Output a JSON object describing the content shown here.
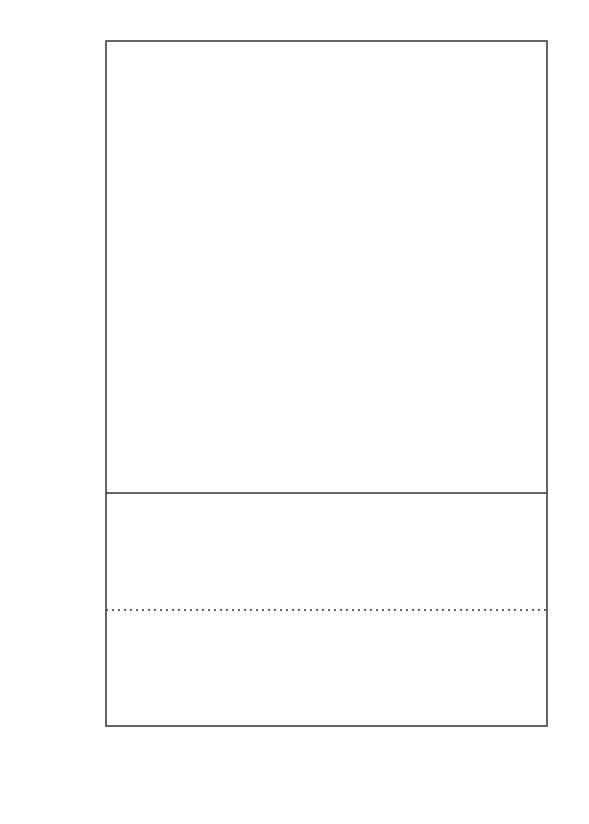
{
  "chart_data": [
    {
      "panel": "top",
      "type": "scatter",
      "title": "",
      "xlabel": "Mass (M_Sun)",
      "ylabel": "Radius (R_Sun)",
      "xlim": [
        1.0,
        0.0
      ],
      "ylim": [
        0.0,
        1.1
      ],
      "x_ticks": [
        "1.0",
        "0.8",
        "0.6",
        "0.4",
        "0.2",
        "0.0"
      ],
      "y_ticks": [
        "0.0",
        "0.2",
        "0.4",
        "0.6",
        "0.8",
        "1.0"
      ],
      "grid": false,
      "legend_position": "upper right",
      "legend": [
        {
          "label": "Single stars (NEW)",
          "color": "#111111"
        },
        {
          "label": "Single stars (published)",
          "color": "#444444"
        },
        {
          "label": "Eclipsing binaries",
          "color": "#c8c8c8"
        },
        {
          "label": "Interferometric binaries",
          "color": "#6e6e6e"
        }
      ],
      "model_curves": [
        {
          "name": "model solid",
          "style": "solid",
          "points": [
            [
              1.0,
              1.0
            ],
            [
              0.9,
              0.905
            ],
            [
              0.8,
              0.8
            ],
            [
              0.7,
              0.7
            ],
            [
              0.6,
              0.6
            ],
            [
              0.5,
              0.5
            ],
            [
              0.4,
              0.4
            ],
            [
              0.3,
              0.3
            ],
            [
              0.2,
              0.21
            ],
            [
              0.15,
              0.16
            ],
            [
              0.1,
              0.115
            ],
            [
              0.075,
              0.085
            ]
          ]
        },
        {
          "name": "model dashed",
          "style": "dashed",
          "points": [
            [
              0.99,
              1.1
            ],
            [
              0.9,
              0.98
            ],
            [
              0.8,
              0.84
            ],
            [
              0.7,
              0.72
            ],
            [
              0.63,
              0.63
            ]
          ]
        }
      ],
      "series": [
        {
          "name": "Single stars (NEW)",
          "color": "#111111",
          "points": [
            {
              "x": 0.92,
              "y": 0.82,
              "xerr": 0.08,
              "yerr": 0
            },
            {
              "x": 0.86,
              "y": 0.795,
              "xerr": 0.1,
              "yerr": 0
            },
            {
              "x": 0.84,
              "y": 0.78,
              "xerr": 0.09,
              "yerr": 0
            },
            {
              "x": 0.84,
              "y": 0.767,
              "xerr": 0.09,
              "yerr": 0
            },
            {
              "x": 0.85,
              "y": 0.75,
              "xerr": 0.09,
              "yerr": 0
            },
            {
              "x": 0.81,
              "y": 0.687,
              "xerr": 0.1,
              "yerr": 0
            },
            {
              "x": 0.78,
              "y": 0.66,
              "xerr": 0.09,
              "yerr": 0
            },
            {
              "x": 0.78,
              "y": 0.648,
              "xerr": 0.09,
              "yerr": 0
            },
            {
              "x": 0.77,
              "y": 0.628,
              "xerr": 0.09,
              "yerr": 0
            },
            {
              "x": 0.62,
              "y": 0.562,
              "xerr": 0.06,
              "yerr": 0
            },
            {
              "x": 0.6,
              "y": 0.565,
              "xerr": 0.06,
              "yerr": 0
            },
            {
              "x": 0.58,
              "y": 0.535,
              "xerr": 0.06,
              "yerr": 0
            },
            {
              "x": 0.49,
              "y": 0.488,
              "xerr": 0.05,
              "yerr": 0
            },
            {
              "x": 0.41,
              "y": 0.412,
              "xerr": 0.05,
              "yerr": 0
            },
            {
              "x": 0.39,
              "y": 0.396,
              "xerr": 0.05,
              "yerr": 0
            },
            {
              "x": 0.4,
              "y": 0.385,
              "xerr": 0.05,
              "yerr": 0
            },
            {
              "x": 0.33,
              "y": 0.343,
              "xerr": 0.03,
              "yerr": 0
            },
            {
              "x": 0.26,
              "y": 0.31,
              "xerr": 0.02,
              "yerr": 0
            },
            {
              "x": 0.16,
              "y": 0.195,
              "xerr": 0.02,
              "yerr": 0
            },
            {
              "x": 0.16,
              "y": 0.186,
              "xerr": 0.02,
              "yerr": 0
            }
          ]
        },
        {
          "name": "Single stars (published)",
          "color": "#444444",
          "points": [
            {
              "x": 0.88,
              "y": 0.935,
              "xerr": 0.12,
              "yerr": 0.07
            },
            {
              "x": 0.78,
              "y": 0.73,
              "xerr": 0.06,
              "yerr": 0.04
            },
            {
              "x": 0.62,
              "y": 0.69,
              "xerr": 0.05,
              "yerr": 0.05
            },
            {
              "x": 0.6,
              "y": 0.705,
              "xerr": 0.05,
              "yerr": 0.05
            },
            {
              "x": 0.7,
              "y": 0.565,
              "xerr": 0.07,
              "yerr": 0.07
            },
            {
              "x": 0.51,
              "y": 0.52,
              "xerr": 0.04,
              "yerr": 0.03
            },
            {
              "x": 0.48,
              "y": 0.48,
              "xerr": 0.04,
              "yerr": 0.03
            },
            {
              "x": 0.46,
              "y": 0.46,
              "xerr": 0.04,
              "yerr": 0.03
            },
            {
              "x": 0.42,
              "y": 0.49,
              "xerr": 0.04,
              "yerr": 0.04
            },
            {
              "x": 0.46,
              "y": 0.43,
              "xerr": 0.04,
              "yerr": 0.03
            }
          ]
        },
        {
          "name": "Eclipsing binaries",
          "color": "#c8c8c8",
          "points": [
            {
              "x": 0.91,
              "y": 1.0,
              "xerr": 0.02,
              "yerr": 0.02
            },
            {
              "x": 0.87,
              "y": 0.965,
              "xerr": 0.01,
              "yerr": 0.01
            },
            {
              "x": 0.73,
              "y": 1.06,
              "xerr": 0,
              "yerr": 0
            },
            {
              "x": 0.89,
              "y": 0.87,
              "xerr": 0.02,
              "yerr": 0.03
            },
            {
              "x": 0.81,
              "y": 0.84,
              "xerr": 0.02,
              "yerr": 0.02
            },
            {
              "x": 0.77,
              "y": 0.84,
              "xerr": 0.02,
              "yerr": 0.02
            },
            {
              "x": 0.59,
              "y": 0.625,
              "xerr": 0.02,
              "yerr": 0.03
            },
            {
              "x": 0.47,
              "y": 0.575,
              "xerr": 0.04,
              "yerr": 0.03
            },
            {
              "x": 0.44,
              "y": 0.505,
              "xerr": 0.04,
              "yerr": 0.03
            },
            {
              "x": 0.48,
              "y": 0.44,
              "xerr": 0.05,
              "yerr": 0.04
            },
            {
              "x": 0.47,
              "y": 0.43,
              "xerr": 0.04,
              "yerr": 0.04
            },
            {
              "x": 0.27,
              "y": 0.28,
              "xerr": 0.03,
              "yerr": 0.02
            },
            {
              "x": 0.26,
              "y": 0.26,
              "xerr": 0.02,
              "yerr": 0.02
            },
            {
              "x": 0.23,
              "y": 0.25,
              "xerr": 0.02,
              "yerr": 0.02
            },
            {
              "x": 0.21,
              "y": 0.23,
              "xerr": 0.02,
              "yerr": 0.02
            },
            {
              "x": 0.19,
              "y": 0.21,
              "xerr": 0.02,
              "yerr": 0.02
            },
            {
              "x": 0.14,
              "y": 0.18,
              "xerr": 0.01,
              "yerr": 0.01
            },
            {
              "x": 0.09,
              "y": 0.12,
              "xerr": 0.01,
              "yerr": 0.01
            }
          ]
        },
        {
          "name": "Interferometric binaries",
          "color": "#6e6e6e",
          "points": [
            {
              "x": 0.85,
              "y": 0.98,
              "xerr": 0.02,
              "yerr": 0.04
            },
            {
              "x": 0.85,
              "y": 0.89,
              "xerr": 0.02,
              "yerr": 0.02
            },
            {
              "x": 0.68,
              "y": 0.73,
              "xerr": 0.01,
              "yerr": 0.08
            },
            {
              "x": 0.84,
              "y": 0.82,
              "xerr": 0.03,
              "yerr": 0.03
            },
            {
              "x": 0.6,
              "y": 0.67,
              "xerr": 0.01,
              "yerr": 0.03
            },
            {
              "x": 0.14,
              "y": 0.14,
              "xerr": 0.01,
              "yerr": 0.01
            }
          ]
        }
      ]
    },
    {
      "panel": "bottom",
      "type": "scatter",
      "title": "",
      "xlabel": "Mass (M_Sun)",
      "ylabel": "(R_Obs-R_Mod)/R_Mod",
      "xlim": [
        1.0,
        0.0
      ],
      "ylim": [
        -0.5,
        0.5
      ],
      "x_ticks": [
        "1.0",
        "0.8",
        "0.6",
        "0.4",
        "0.2",
        "0.0"
      ],
      "y_ticks": [
        "-0.4",
        "-0.2",
        "0.0",
        "0.2",
        "0.4"
      ],
      "reference_line": {
        "y": 0.0,
        "style": "dotted"
      },
      "grid": false,
      "series": [
        {
          "name": "Single stars (NEW)",
          "color": "#111111",
          "points": [
            {
              "x": 0.91,
              "y": -0.035,
              "xerr": 0.08
            },
            {
              "x": 0.86,
              "y": -0.01,
              "xerr": 0.1
            },
            {
              "x": 0.84,
              "y": 0.02,
              "xerr": 0.09
            },
            {
              "x": 0.84,
              "y": 0.0,
              "xerr": 0.09
            },
            {
              "x": 0.85,
              "y": -0.05,
              "xerr": 0.09
            },
            {
              "x": 0.81,
              "y": -0.07,
              "xerr": 0.1
            },
            {
              "x": 0.77,
              "y": -0.05,
              "xerr": 0.09
            },
            {
              "x": 0.77,
              "y": -0.04,
              "xerr": 0.09
            },
            {
              "x": 0.775,
              "y": -0.11,
              "xerr": 0.09
            },
            {
              "x": 0.65,
              "y": -0.08,
              "xerr": 0.05
            },
            {
              "x": 0.6,
              "y": -0.005,
              "xerr": 0.06
            },
            {
              "x": 0.58,
              "y": -0.03,
              "xerr": 0.06
            },
            {
              "x": 0.59,
              "y": -0.02,
              "xerr": 0.06
            },
            {
              "x": 0.49,
              "y": 0.035,
              "xerr": 0.05
            },
            {
              "x": 0.41,
              "y": 0.1,
              "xerr": 0.05
            },
            {
              "x": 0.4,
              "y": 0.08,
              "xerr": 0.05
            },
            {
              "x": 0.41,
              "y": 0.005,
              "xerr": 0.05
            },
            {
              "x": 0.33,
              "y": 0.08,
              "xerr": 0.04
            },
            {
              "x": 0.25,
              "y": 0.21,
              "xerr": 0.02
            },
            {
              "x": 0.16,
              "y": 0.05,
              "xerr": 0.02
            }
          ]
        },
        {
          "name": "Single stars (published)",
          "color": "#444444",
          "points": [
            {
              "x": 0.84,
              "y": 0.17,
              "xerr": 0.02,
              "yerr": 0.03
            },
            {
              "x": 0.84,
              "y": 0.03,
              "xerr": 0.05,
              "yerr": 0.02
            },
            {
              "x": 0.77,
              "y": 0.03,
              "xerr": 0.07,
              "yerr": 0.02
            },
            {
              "x": 0.62,
              "y": -0.02,
              "xerr": 0.04,
              "yerr": 0.02
            },
            {
              "x": 0.62,
              "y": -0.07,
              "xerr": 0.04,
              "yerr": 0.02
            },
            {
              "x": 0.47,
              "y": 0.13,
              "xerr": 0.05,
              "yerr": 0.03
            },
            {
              "x": 0.47,
              "y": 0.07,
              "xerr": 0.05,
              "yerr": 0.02
            },
            {
              "x": 0.36,
              "y": 0.16,
              "xerr": 0.04,
              "yerr": 0.03
            },
            {
              "x": 0.155,
              "y": 0.12,
              "xerr": 0.01,
              "yerr": 0.03
            }
          ]
        },
        {
          "name": "Eclipsing binaries",
          "color": "#c8c8c8",
          "points": [
            {
              "x": 0.91,
              "y": 0.09,
              "xerr": 0.01
            },
            {
              "x": 0.88,
              "y": 0.1,
              "xerr": 0.01
            },
            {
              "x": 0.82,
              "y": 0.055,
              "xerr": 0.01
            },
            {
              "x": 0.78,
              "y": 0.09,
              "xerr": 0.01
            },
            {
              "x": 0.76,
              "y": 0.145,
              "xerr": 0.01
            },
            {
              "x": 0.59,
              "y": 0.09,
              "xerr": 0.01
            },
            {
              "x": 0.48,
              "y": 0.3,
              "xerr": 0.05,
              "yerr": 0.02
            },
            {
              "x": 0.47,
              "y": -0.04,
              "xerr": 0.04,
              "yerr": 0.03
            },
            {
              "x": 0.27,
              "y": 0.0,
              "xerr": 0.02,
              "yerr": 0.03
            },
            {
              "x": 0.26,
              "y": -0.04,
              "xerr": 0.03,
              "yerr": 0.03
            },
            {
              "x": 0.23,
              "y": 0.05,
              "xerr": 0.01
            },
            {
              "x": 0.21,
              "y": 0.07,
              "xerr": 0.01
            },
            {
              "x": 0.19,
              "y": 0.015,
              "xerr": 0.01
            }
          ]
        },
        {
          "name": "Interferometric binaries",
          "color": "#6e6e6e",
          "points": [
            {
              "x": 0.115,
              "y": 0.0,
              "xerr": 0.01,
              "yerr": 0.04
            }
          ]
        }
      ]
    }
  ],
  "labels": {
    "y_top": "Radius (R",
    "y_top_sub": "Sun",
    "y_top_close": ")",
    "y_bot_a": "(R",
    "y_bot_sub1": "Obs",
    "y_bot_b": "-R",
    "y_bot_sub2": "Mod",
    "y_bot_c": ")/R",
    "y_bot_sub3": "Mod",
    "x_main": "Mass (M",
    "x_sub": "Sun",
    "x_close": ")"
  }
}
